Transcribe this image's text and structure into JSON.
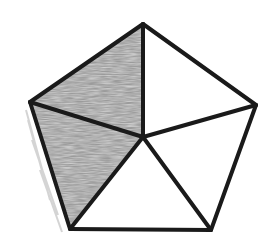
{
  "diagram": {
    "type": "pentagon-divided-into-triangles",
    "colors": {
      "background": "#ffffff",
      "stroke": "#1a1a1a",
      "shade": "#a8a8a8"
    },
    "stroke_width": 4,
    "vertices": {
      "top": [
        143,
        24
      ],
      "right": [
        256,
        105
      ],
      "bottom_right": [
        211,
        230
      ],
      "bottom_left": [
        70,
        229
      ],
      "left": [
        30,
        102
      ],
      "center": [
        143,
        137
      ]
    },
    "triangles": [
      {
        "id": "top-left",
        "points": [
          "top",
          "left",
          "center"
        ],
        "shaded": true
      },
      {
        "id": "left-bottom",
        "points": [
          "left",
          "bottom_left",
          "center"
        ],
        "shaded": true
      },
      {
        "id": "bottom",
        "points": [
          "bottom_left",
          "bottom_right",
          "center"
        ],
        "shaded": false
      },
      {
        "id": "bottom-right",
        "points": [
          "bottom_right",
          "right",
          "center"
        ],
        "shaded": false
      },
      {
        "id": "top-right",
        "points": [
          "right",
          "top",
          "center"
        ],
        "shaded": false
      }
    ],
    "shaded_count": 2,
    "total_parts": 5
  }
}
